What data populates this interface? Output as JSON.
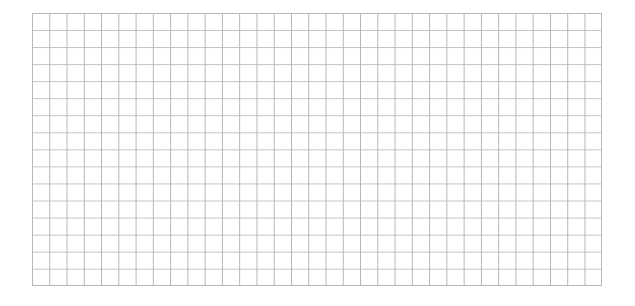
{
  "canvas": {
    "width": 635,
    "height": 306,
    "background_color": "#ffffff"
  },
  "grid": {
    "label": "grid",
    "x": 32,
    "y": 13,
    "width": 570,
    "height": 273,
    "columns": 33,
    "rows": 16,
    "cell_width": 17.27,
    "cell_height": 17.06,
    "vertical_line_color": "#b4b4b4",
    "horizontal_line_color": "#c2c2c2",
    "edge_line_color": "#b9b9b9",
    "line_width": 1,
    "background_color": "#ffffff"
  },
  "chart_data": {
    "type": "line",
    "title": "",
    "subtitle": "",
    "xlabel": "",
    "ylabel": "",
    "series": [],
    "categories": [],
    "x_tick_labels": [],
    "y_tick_labels": [],
    "legend": [],
    "legend_position": "none",
    "annotations": [],
    "grid": "on",
    "grid_columns": 33,
    "grid_rows": 16,
    "xlim": [
      0,
      33
    ],
    "ylim": [
      0,
      16
    ]
  }
}
